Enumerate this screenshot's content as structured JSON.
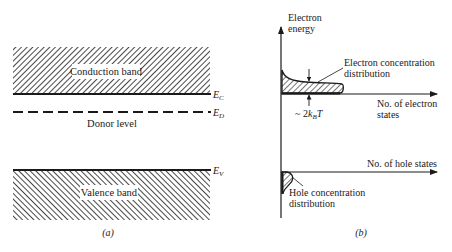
{
  "panel_a": {
    "caption": "(a)",
    "conduction_band": {
      "label": "Conduction band",
      "edge_label_main": "E",
      "edge_label_sub": "C"
    },
    "donor_level": {
      "label": "Donor level",
      "edge_label_main": "E",
      "edge_label_sub": "D"
    },
    "valence_band": {
      "label": "Valence band",
      "edge_label_main": "E",
      "edge_label_sub": "V"
    }
  },
  "panel_b": {
    "caption": "(b)",
    "y_axis_label_line1": "Electron",
    "y_axis_label_line2": "energy",
    "electron_axis_label_line1": "No. of electron",
    "electron_axis_label_line2": "states",
    "hole_axis_label": "No. of hole states",
    "electron_dist_label_line1": "Electron concentration",
    "electron_dist_label_line2": "distribution",
    "hole_dist_label_line1": "Hole concentration",
    "hole_dist_label_line2": "distribution",
    "width_label_prefix": "~ 2",
    "width_label_k": "k",
    "width_label_sub": "B",
    "width_label_T": "T"
  },
  "colors": {
    "ink": "#1a1a1a",
    "background": "#ffffff"
  }
}
